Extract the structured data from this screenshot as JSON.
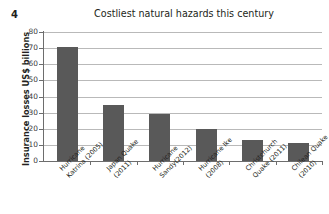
{
  "figure_number": "4",
  "chart_data": {
    "type": "bar",
    "title": "Costliest natural hazards this century",
    "xlabel": "",
    "ylabel": "Insurance losses US$ billions",
    "ylim": [
      0,
      80
    ],
    "ytick_step": 10,
    "ytick_labels": [
      "80",
      "70",
      "60",
      "50",
      "40",
      "30",
      "20",
      "10",
      "0"
    ],
    "grid": "horizontal",
    "legend": "none",
    "bar_color": "#595959",
    "gridline_color": "#b9b9b9",
    "axis_color": "#6d6d6d",
    "categories": [
      "Hurricane Katrina (2005)",
      "Japan Quake (2011)",
      "Hurricane Sandy(2012)",
      "Hurricane Ike (2008)",
      "Christchurch Quake (2011)",
      "Chilean Quake (2010)"
    ],
    "category_lines": [
      [
        "Hurricane",
        "Katrina (2005)"
      ],
      [
        "Japan Quake",
        "(2011)"
      ],
      [
        "Hurricane",
        "Sandy(2012)"
      ],
      [
        "Hurricane Ike",
        "(2008)"
      ],
      [
        "Christchurch",
        "Quake (2011)"
      ],
      [
        "Chilean Quake",
        "(2010)"
      ]
    ],
    "values": [
      71,
      35,
      29,
      20,
      13,
      11
    ]
  }
}
